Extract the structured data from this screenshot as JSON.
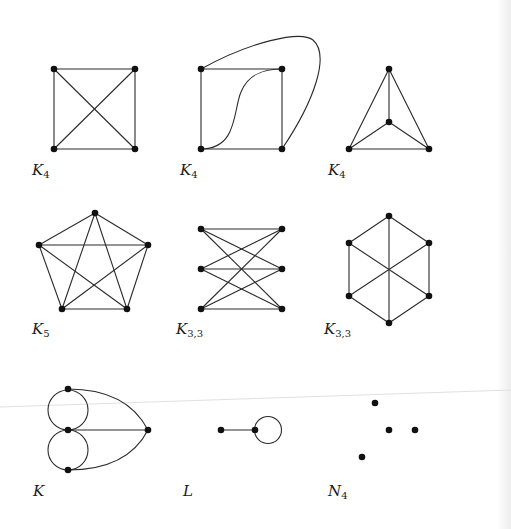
{
  "figure": {
    "background": "#ffffff",
    "edge_color": "#2a2a2a",
    "vertex_color": "#111111",
    "graphs": [
      {
        "id": "k4-square",
        "label_main": "K",
        "label_sub": "4",
        "vertices": 4,
        "edges": 6,
        "drawing": "square with both diagonals"
      },
      {
        "id": "k4-curved",
        "label_main": "K",
        "label_sub": "4",
        "vertices": 4,
        "edges": 6,
        "drawing": "square with curved S-edge and outer curved edge (planar)"
      },
      {
        "id": "k4-triangle",
        "label_main": "K",
        "label_sub": "4",
        "vertices": 4,
        "edges": 6,
        "drawing": "triangle with central vertex (planar)"
      },
      {
        "id": "k5-pentagon",
        "label_main": "K",
        "label_sub": "5",
        "vertices": 5,
        "edges": 10,
        "drawing": "pentagon with pentagram"
      },
      {
        "id": "k33-bipartite",
        "label_main": "K",
        "label_sub": "3,3",
        "vertices": 6,
        "edges": 9,
        "drawing": "two columns of three vertices"
      },
      {
        "id": "k33-hexagon",
        "label_main": "K",
        "label_sub": "3,3",
        "vertices": 6,
        "edges": 9,
        "drawing": "hexagon with three long diagonals"
      },
      {
        "id": "k-multigraph",
        "label_main": "K",
        "label_sub": "",
        "vertices": 4,
        "edges": 5,
        "drawing": "multigraph with two loops and two curved edges"
      },
      {
        "id": "l-loop",
        "label_main": "L",
        "label_sub": "",
        "vertices": 2,
        "edges": 2,
        "drawing": "edge plus a loop"
      },
      {
        "id": "n4-null",
        "label_main": "N",
        "label_sub": "4",
        "vertices": 4,
        "edges": 0,
        "drawing": "four isolated vertices"
      }
    ]
  }
}
